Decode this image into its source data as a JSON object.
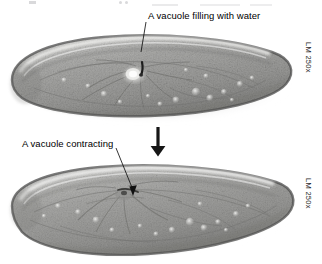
{
  "figure": {
    "top_panel": {
      "annotation_label": "A vacuole filling with water",
      "magnification_label": "LM 250x",
      "specimen": "paramecium-contractile-vacuole-filling"
    },
    "bottom_panel": {
      "annotation_label": "A vacuole contracting",
      "magnification_label": "LM 250x",
      "specimen": "paramecium-contractile-vacuole-contracting"
    },
    "transition": {
      "icon": "down-arrow-icon"
    },
    "colors": {
      "background": "#ffffff",
      "text": "#000000",
      "arrow": "#161616",
      "cell_body": "#9d9d9d",
      "cell_highlight": "#e8e8e6",
      "cell_outline": "#5e5e5e"
    }
  }
}
